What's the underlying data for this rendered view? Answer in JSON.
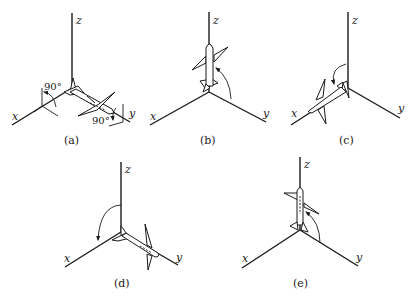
{
  "figure": {
    "panels": [
      {
        "id": "a",
        "caption": "(a)",
        "axes": {
          "x": "x",
          "y": "y",
          "z": "z"
        },
        "annotations": [
          "90°",
          "90°"
        ],
        "description": "Airplane lying along y-axis with tail at origin; 90° rotations marked about x and y axes"
      },
      {
        "id": "b",
        "caption": "(b)",
        "axes": {
          "x": "x",
          "y": "y",
          "z": "z"
        },
        "annotations": [],
        "description": "Airplane pointing up along z-axis; arrow from y toward z"
      },
      {
        "id": "c",
        "caption": "(c)",
        "axes": {
          "x": "x",
          "y": "y",
          "z": "z"
        },
        "annotations": [],
        "description": "Airplane lying along x-axis; arrow from z toward x"
      },
      {
        "id": "d",
        "caption": "(d)",
        "axes": {
          "x": "x",
          "y": "y",
          "z": "z"
        },
        "annotations": [],
        "description": "Airplane lying along y-axis; arrow from z toward x"
      },
      {
        "id": "e",
        "caption": "(e)",
        "axes": {
          "x": "x",
          "y": "y",
          "z": "z"
        },
        "annotations": [],
        "description": "Airplane pointing up along z-axis; arrow from y toward z"
      }
    ]
  }
}
